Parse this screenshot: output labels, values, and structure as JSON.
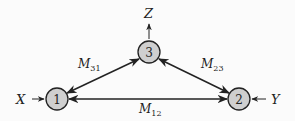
{
  "diagram": {
    "type": "network",
    "nodes": [
      {
        "id": "1",
        "label": "1",
        "cx": 57,
        "cy": 99
      },
      {
        "id": "2",
        "label": "2",
        "cx": 239,
        "cy": 99
      },
      {
        "id": "3",
        "label": "3",
        "cx": 149,
        "cy": 52
      }
    ],
    "edges": [
      {
        "from": "3",
        "to": "1",
        "bidirectional": true,
        "label": "M",
        "sub": "31"
      },
      {
        "from": "2",
        "to": "3",
        "bidirectional": true,
        "label": "M",
        "sub": "23"
      },
      {
        "from": "1",
        "to": "2",
        "bidirectional": true,
        "label": "M",
        "sub": "12"
      }
    ],
    "io": [
      {
        "label": "X",
        "node": "1",
        "direction": "in"
      },
      {
        "label": "Y",
        "node": "2",
        "direction": "in"
      },
      {
        "label": "Z",
        "node": "3",
        "direction": "out"
      }
    ],
    "colors": {
      "node_fill": "#cfcfcf",
      "stroke": "#222222"
    }
  }
}
